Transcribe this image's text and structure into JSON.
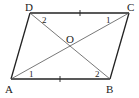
{
  "figure": {
    "type": "parallelogram",
    "name": "ABCD",
    "stroke_color": "#222222",
    "diagonal_color": "#555555",
    "background": "#ffffff"
  },
  "vertices": {
    "A": {
      "label": "A",
      "x": 11,
      "y": 79,
      "lx": 9,
      "ly": 93
    },
    "B": {
      "label": "B",
      "x": 110,
      "y": 79,
      "lx": 110,
      "ly": 93
    },
    "C": {
      "label": "C",
      "x": 129,
      "y": 13,
      "lx": 132,
      "ly": 10
    },
    "D": {
      "label": "D",
      "x": 30,
      "y": 13,
      "lx": 28,
      "ly": 10
    },
    "O": {
      "label": "O",
      "x": 70,
      "y": 46,
      "lx": 70,
      "ly": 42
    }
  },
  "angle_labels": [
    {
      "name": "angle-d2",
      "text": "2",
      "x": 44,
      "y": 22
    },
    {
      "name": "angle-c1",
      "text": "1",
      "x": 108,
      "y": 22
    },
    {
      "name": "angle-a1",
      "text": "1",
      "x": 31,
      "y": 77
    },
    {
      "name": "angle-b2",
      "text": "2",
      "x": 97,
      "y": 77
    }
  ],
  "equal_marks": [
    {
      "segment": "DC",
      "x": 80,
      "y": 13
    },
    {
      "segment": "AB",
      "x": 60,
      "y": 79
    }
  ]
}
